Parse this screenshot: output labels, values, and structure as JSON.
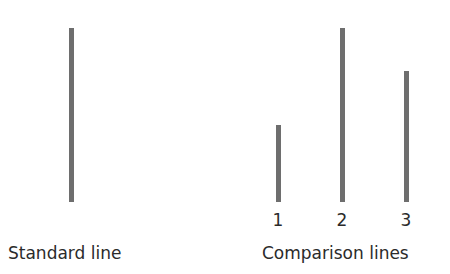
{
  "standard": {
    "label": "Standard line",
    "line": {
      "x": 69,
      "top": 28,
      "bottom": 202
    }
  },
  "comparison": {
    "label": "Comparison lines",
    "lines": [
      {
        "label": "1",
        "x": 276,
        "top": 125,
        "bottom": 202
      },
      {
        "label": "2",
        "x": 340,
        "top": 28,
        "bottom": 202
      },
      {
        "label": "3",
        "x": 404,
        "top": 71,
        "bottom": 202
      }
    ]
  },
  "colors": {
    "line": "#6e6e6e",
    "text": "#2b2b2b",
    "background": "#ffffff"
  }
}
